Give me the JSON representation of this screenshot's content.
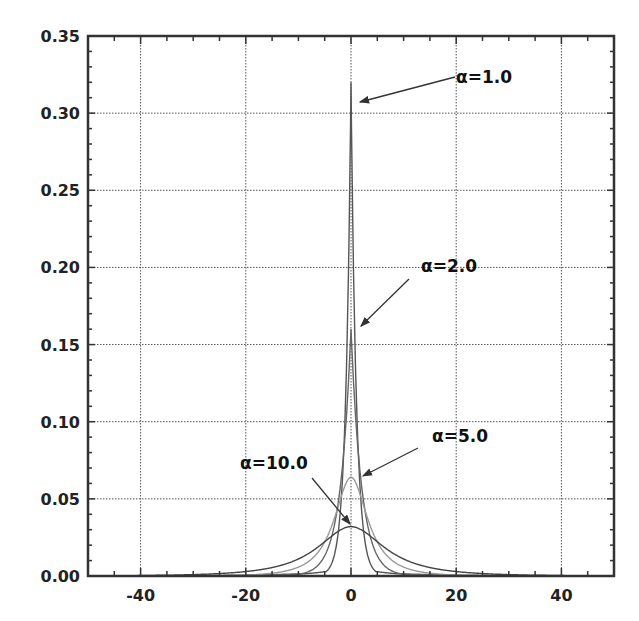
{
  "chart_data": {
    "type": "line",
    "title": "",
    "xlabel": "",
    "ylabel": "",
    "xlim": [
      -50,
      50
    ],
    "ylim": [
      0,
      0.35
    ],
    "grid": true,
    "legend": "none (curves labeled by arrow annotations)",
    "x_ticks": [
      -40,
      -20,
      0,
      20,
      40
    ],
    "x_tick_labels": [
      "-40",
      "-20",
      "0",
      "20",
      "40"
    ],
    "y_ticks": [
      0.0,
      0.05,
      0.1,
      0.15,
      0.2,
      0.25,
      0.3,
      0.35
    ],
    "y_tick_labels": [
      "0.00",
      "0.05",
      "0.10",
      "0.15",
      "0.20",
      "0.25",
      "0.30",
      "0.35"
    ],
    "series": [
      {
        "name": "α=1.0",
        "alpha": 1.0,
        "peak_x": 0,
        "peak_y": 0.32,
        "color": "#555555"
      },
      {
        "name": "α=2.0",
        "alpha": 2.0,
        "peak_x": 0,
        "peak_y": 0.16,
        "color": "#666666"
      },
      {
        "name": "α=5.0",
        "alpha": 5.0,
        "peak_x": 0,
        "peak_y": 0.064,
        "color": "#999999"
      },
      {
        "name": "α=10.0",
        "alpha": 10.0,
        "peak_x": 0,
        "peak_y": 0.032,
        "color": "#444444"
      }
    ],
    "annotations": [
      {
        "text": "α=1.0",
        "points_to": [
          0.5,
          0.307
        ]
      },
      {
        "text": "α=2.0",
        "points_to": [
          1.0,
          0.162
        ]
      },
      {
        "text": "α=5.0",
        "points_to": [
          1.0,
          0.064
        ]
      },
      {
        "text": "α=10.0",
        "points_to": [
          0,
          0.033
        ]
      }
    ]
  }
}
